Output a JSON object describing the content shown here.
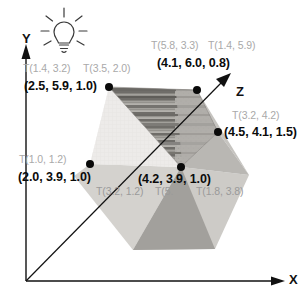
{
  "figure": {
    "background_color": "#ffffff",
    "vertex_label_color": "#0b0b0b",
    "texcoord_label_color": "#a9a9a9",
    "axis_color": "#111111"
  },
  "axes": {
    "y": {
      "label": "Y",
      "x": 22,
      "y": 44
    },
    "x": {
      "label": "X",
      "x": 289,
      "y": 277
    },
    "z": {
      "label": "Z",
      "x": 237,
      "y": 88
    }
  },
  "icons": {
    "light": {
      "name": "light-bulb-icon",
      "x": 62,
      "y": 26
    }
  },
  "vertices": [
    {
      "id": "v0",
      "position_label": "(2.5, 5.9, 1.0)",
      "x": 109,
      "y": 87,
      "label_x": 24,
      "label_y": 80
    },
    {
      "id": "v1",
      "position_label": "(4.1, 6.0, 0.8)",
      "x": 197,
      "y": 90,
      "label_x": 157,
      "label_y": 57
    },
    {
      "id": "v2",
      "position_label": "(4.5, 4.1, 1.5)",
      "x": 218,
      "y": 132,
      "label_x": 223,
      "label_y": 126
    },
    {
      "id": "v3",
      "position_label": "(2.0, 3.9, 1.0)",
      "x": 90,
      "y": 164,
      "label_x": 18,
      "label_y": 171
    },
    {
      "id": "v4",
      "position_label": "(4.2, 3.9, 1.0)",
      "x": 181,
      "y": 167,
      "label_x": 138,
      "label_y": 174
    }
  ],
  "texture_coords": [
    {
      "id": "t0",
      "label": "T(1.4, 3.2)",
      "x": 23,
      "y": 63
    },
    {
      "id": "t1",
      "label": "T(3.5, 2.0)",
      "x": 83,
      "y": 63
    },
    {
      "id": "t2",
      "label": "T(5.8, 3.3)",
      "x": 151,
      "y": 40
    },
    {
      "id": "t3",
      "label": "T(1.4, 5.9)",
      "x": 208,
      "y": 40
    },
    {
      "id": "t4",
      "label": "T(3.2, 4.2)",
      "x": 232,
      "y": 110
    },
    {
      "id": "t5",
      "label": "T(1.0, 1.2)",
      "x": 19,
      "y": 154
    },
    {
      "id": "t6",
      "label": "T(3.2, 1.2)",
      "x": 96,
      "y": 186
    },
    {
      "id": "t7",
      "label": "T(5.",
      "x": 155,
      "y": 186
    },
    {
      "id": "t8",
      "label": "T(1.8, 3.8)",
      "x": 196,
      "y": 186
    }
  ],
  "shape": {
    "name": "textured-polyhedron",
    "faces": [
      {
        "id": "face-left-light",
        "fill": "#ededea",
        "points": "109,87 90,164 181,167"
      },
      {
        "id": "face-top-textured",
        "fill": "#9a9893",
        "points": "109,87 197,90 218,132 181,167"
      },
      {
        "id": "face-right-mid",
        "fill": "#c8c6c2",
        "points": "197,90 248,175 218,132"
      },
      {
        "id": "face-lower-left",
        "fill": "#d6d4d0",
        "points": "90,164 181,167 133,250 75,175"
      },
      {
        "id": "face-lower-mid-dark",
        "fill": "#a3a19d",
        "points": "133,250 181,167 215,250"
      },
      {
        "id": "face-lower-right",
        "fill": "#cfcdc9",
        "points": "181,167 248,175 215,250"
      }
    ]
  }
}
